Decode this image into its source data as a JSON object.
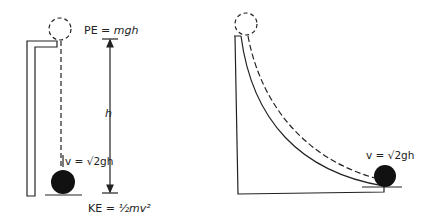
{
  "left_figure": {
    "pe_label": "PE = ",
    "pe_var": "mgh",
    "h_label": "h",
    "v_label": "v = √2gh",
    "ke_label": "KE = ",
    "ke_var": "½mv²"
  },
  "right_figure": {
    "v_label": "v = √2gh"
  },
  "colors": {
    "ink": "#222222",
    "background": "#ffffff"
  }
}
